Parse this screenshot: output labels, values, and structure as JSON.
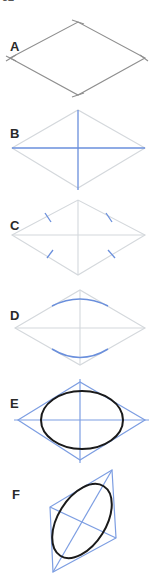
{
  "figure": {
    "top_fragment": "52",
    "steps": [
      {
        "label": "A",
        "description": "Draw a rhombus"
      },
      {
        "label": "B",
        "description": "Draw the diagonals"
      },
      {
        "label": "C",
        "description": "Mark side midpoints"
      },
      {
        "label": "D",
        "description": "Draw arcs between midpoints"
      },
      {
        "label": "E",
        "description": "Complete the ellipse inside the rhombus"
      },
      {
        "label": "F",
        "description": "Ellipse in a tilted rhombus"
      }
    ]
  },
  "colors": {
    "pencil": "#9a9a9a",
    "faint": "#d4d8dc",
    "blue": "#6a8fdc",
    "ink": "#1a1a1a"
  }
}
